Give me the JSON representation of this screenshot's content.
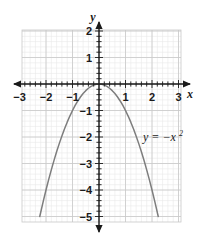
{
  "figure": {
    "title": "",
    "equation_label": {
      "base": "y = −x",
      "exponent": "2"
    },
    "axis_labels": {
      "x": "x",
      "y": "y"
    },
    "colors": {
      "curve": "#7d7d7d",
      "axis": "#1a1a1a",
      "grid_major": "#c9c9c9",
      "grid_minor": "#e6e6e6",
      "text": "#1a1a1a",
      "background": "#ffffff"
    },
    "x_tick_labels": [
      "-3",
      "-2",
      "-1",
      "1",
      "2",
      "3"
    ],
    "y_tick_labels": [
      "2",
      "1",
      "-1",
      "-2",
      "-3",
      "-4",
      "-5"
    ]
  },
  "chart_data": {
    "type": "line",
    "title": "",
    "xlabel": "x",
    "ylabel": "y",
    "xlim": [
      -3,
      3
    ],
    "ylim": [
      -5,
      2
    ],
    "grid": true,
    "grid_major_step": 1,
    "grid_minor_step": 0.2,
    "legend": "none",
    "annotations": [
      {
        "text": "y = −x²",
        "x": 1.45,
        "y": -1.9
      }
    ],
    "xticks": [
      -3,
      -2,
      -1,
      0,
      1,
      2,
      3
    ],
    "yticks": [
      2,
      1,
      0,
      -1,
      -2,
      -3,
      -4,
      -5
    ],
    "series": [
      {
        "name": "y = -x^2",
        "equation": "y = -x^2",
        "color": "#7d7d7d",
        "x": [
          -2.236,
          -2.1,
          -2.0,
          -1.9,
          -1.8,
          -1.7,
          -1.6,
          -1.5,
          -1.4,
          -1.3,
          -1.2,
          -1.1,
          -1.0,
          -0.9,
          -0.8,
          -0.7,
          -0.6,
          -0.5,
          -0.4,
          -0.3,
          -0.2,
          -0.1,
          0.0,
          0.1,
          0.2,
          0.3,
          0.4,
          0.5,
          0.6,
          0.7,
          0.8,
          0.9,
          1.0,
          1.1,
          1.2,
          1.3,
          1.4,
          1.5,
          1.6,
          1.7,
          1.8,
          1.9,
          2.0,
          2.1,
          2.236
        ],
        "y": [
          -5.0,
          -4.41,
          -4.0,
          -3.61,
          -3.24,
          -2.89,
          -2.56,
          -2.25,
          -1.96,
          -1.69,
          -1.44,
          -1.21,
          -1.0,
          -0.81,
          -0.64,
          -0.49,
          -0.36,
          -0.25,
          -0.16,
          -0.09,
          -0.04,
          -0.01,
          0.0,
          -0.01,
          -0.04,
          -0.09,
          -0.16,
          -0.25,
          -0.36,
          -0.49,
          -0.64,
          -0.81,
          -1.0,
          -1.21,
          -1.44,
          -1.69,
          -1.96,
          -2.25,
          -2.56,
          -2.89,
          -3.24,
          -3.61,
          -4.0,
          -4.41,
          -5.0
        ]
      }
    ]
  }
}
